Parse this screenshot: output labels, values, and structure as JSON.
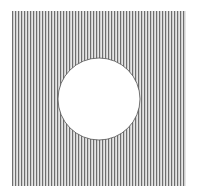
{
  "figure": {
    "square": {
      "x": 12,
      "y": 11,
      "width": 174,
      "height": 175
    },
    "circle": {
      "cx": 99,
      "cy": 99,
      "r": 41
    },
    "hatch": {
      "direction": "vertical",
      "period": 3,
      "line_width": 1.2
    },
    "colors": {
      "background": "#ffffff",
      "hatch_line": "#6e6e6e",
      "hatch_gap": "#e6e6e6",
      "circle_fill": "#ffffff",
      "circle_stroke": "#555555"
    }
  }
}
